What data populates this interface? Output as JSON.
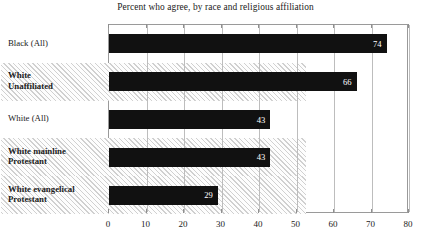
{
  "chart_data": {
    "type": "bar",
    "orientation": "horizontal",
    "title": "Percent who agree, by race and religious affiliation",
    "xlabel": "",
    "ylabel": "",
    "xlim": [
      0,
      80
    ],
    "xticks": [
      0,
      10,
      20,
      30,
      40,
      50,
      60,
      70,
      80
    ],
    "xtick_labels": [
      "0",
      "10",
      "20",
      "30",
      "40",
      "50",
      "60",
      "70",
      "80"
    ],
    "grid": true,
    "legend": "none",
    "bar_color": "#111111",
    "value_label_color": "#ffffff",
    "band_color": "#ebebeb",
    "categories": [
      "Black (All)",
      "White\nUnaffiliated",
      "White (All)",
      "White mainline\nProtestant",
      "White evangelical\nProtestant"
    ],
    "values": [
      74,
      66,
      43,
      43,
      29
    ],
    "value_labels": [
      "74",
      "66",
      "43",
      "43",
      "29"
    ],
    "category_bold": [
      false,
      true,
      false,
      true,
      true
    ],
    "row_shaded": [
      false,
      true,
      false,
      true,
      true
    ]
  }
}
